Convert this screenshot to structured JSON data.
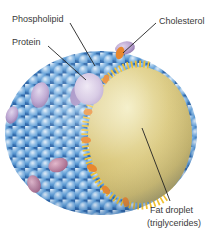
{
  "diagram": {
    "labels": {
      "phospholipid": "Phospholipid",
      "protein": "Protein",
      "cholesterol": "Cholesterol",
      "fat_droplet_line1": "Fat droplet",
      "fat_droplet_line2": "(triglycerides)"
    },
    "colors": {
      "membrane_ball_blue": "#5b9bd5",
      "membrane_ball_dark": "#2f6cae",
      "protein_purple": "#b9a2cf",
      "protein_pink": "#b5638f",
      "cholesterol_orange": "#e8872e",
      "tails_yellow": "#f0c030",
      "fat_droplet_tan": "#d8c87c",
      "label_text": "#3a3a3a",
      "leader_line": "#222222",
      "background": "#ffffff"
    }
  }
}
